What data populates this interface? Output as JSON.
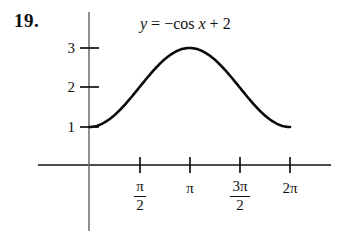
{
  "problem": {
    "number": "19."
  },
  "equation": {
    "lhs": "y",
    "equals": "=",
    "rhs_sign": "−",
    "rhs_fn": "cos",
    "rhs_var": "x",
    "rhs_plus": "+",
    "rhs_const": "2",
    "full_text": "y = −cos x + 2"
  },
  "axes": {
    "y_tick_labels": [
      "1",
      "2",
      "3"
    ],
    "x_tick_labels": [
      "π/2",
      "π",
      "3π/2",
      "2π"
    ],
    "x_tick_parts": [
      {
        "num": "π",
        "den": "2",
        "plain": ""
      },
      {
        "num": "",
        "den": "",
        "plain": "π"
      },
      {
        "num": "3π",
        "den": "2",
        "plain": ""
      },
      {
        "num": "",
        "den": "",
        "plain": "2π"
      }
    ],
    "axis_color": "#111111",
    "curve_color": "#0a0a0a"
  },
  "chart_data": {
    "type": "line",
    "xlabel": "",
    "ylabel": "",
    "function": "y = -cos(x) + 2",
    "xlim": [
      0,
      6.283185307179586
    ],
    "ylim": [
      0,
      3.4
    ],
    "grid": false,
    "legend": "none",
    "x_tick_values": [
      1.5707963,
      3.1415927,
      4.712389,
      6.2831853
    ],
    "x_tick_labels": [
      "π/2",
      "π",
      "3π/2",
      "2π"
    ],
    "y_tick_values": [
      1,
      2,
      3
    ],
    "y_tick_labels": [
      "1",
      "2",
      "3"
    ],
    "series": [
      {
        "name": "y = -cos x + 2",
        "x": [
          0,
          0.3141593,
          0.6283185,
          0.9424778,
          1.2566371,
          1.5707963,
          1.8849556,
          2.1991149,
          2.5132741,
          2.8274334,
          3.1415927,
          3.4557519,
          3.7699112,
          4.0840704,
          4.3982297,
          4.712389,
          5.0265482,
          5.3407075,
          5.6548668,
          5.969026,
          6.2831853
        ],
        "y": [
          1.0,
          1.0489435,
          1.190983,
          1.4122147,
          1.690983,
          2.0,
          2.309017,
          2.5877853,
          2.809017,
          2.9510565,
          3.0,
          2.9510565,
          2.809017,
          2.5877853,
          2.309017,
          2.0,
          1.690983,
          1.4122147,
          1.190983,
          1.0489435,
          1.0
        ]
      }
    ]
  }
}
